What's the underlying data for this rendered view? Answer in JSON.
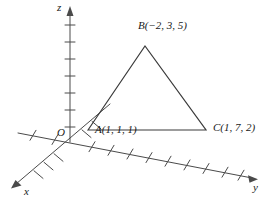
{
  "figure": {
    "type": "3d-coordinate-axes-triangle",
    "background_color": "#ffffff",
    "stroke_color": "#4a4a4a",
    "text_color": "#1a1a1a",
    "origin_label": "O",
    "axes": [
      {
        "name": "x",
        "label": "x",
        "direction": "down-left",
        "arrow": true
      },
      {
        "name": "y",
        "label": "y",
        "direction": "down-right",
        "arrow": true
      },
      {
        "name": "z",
        "label": "z",
        "direction": "up",
        "arrow": true
      }
    ],
    "points": [
      {
        "id": "A",
        "name": "A",
        "coords": "(1, 1, 1)",
        "label": "A(1, 1, 1)"
      },
      {
        "id": "B",
        "name": "B",
        "coords": "(−2, 3, 5)",
        "label": "B(−2, 3, 5)"
      },
      {
        "id": "C",
        "name": "C",
        "coords": "(1, 7, 2)",
        "label": "C(1, 7, 2)"
      }
    ],
    "triangle": {
      "vertices": [
        "A",
        "B",
        "C"
      ],
      "filled": false
    },
    "tick_counts": {
      "z_axis": 7,
      "y_axis_positive": 9,
      "y_axis_negative": 2,
      "x_axis_positive": 5
    }
  }
}
